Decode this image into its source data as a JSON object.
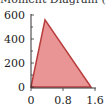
{
  "chart_data": {
    "type": "area",
    "title": "Moment Diagram (x 10",
    "xlabel": "",
    "ylabel": "",
    "x": [
      0,
      0.35,
      1.5
    ],
    "series": [
      {
        "name": "moment",
        "values": [
          0,
          560,
          0
        ],
        "fill": "#e88a8a",
        "stroke": "#b83c3c"
      }
    ],
    "xlim": [
      0,
      1.6
    ],
    "ylim": [
      0,
      600
    ],
    "xticks": [
      "0",
      "0.8",
      "1.6"
    ],
    "yticks": [
      "0",
      "200",
      "400",
      "600"
    ],
    "grid": false,
    "legend": null
  }
}
